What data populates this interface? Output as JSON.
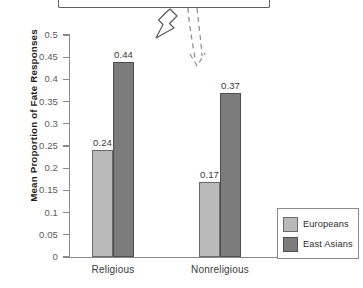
{
  "chart_data": {
    "type": "bar",
    "title": "",
    "subtitle": "",
    "xlabel": "",
    "ylabel": "Mean Proportion of Fate Responses",
    "categories": [
      "Religious",
      "Nonreligious"
    ],
    "series": [
      {
        "name": "Europeans",
        "color": "#b9b9b9",
        "values": [
          0.24,
          0.17
        ],
        "labels": [
          "0.24",
          "0.17"
        ]
      },
      {
        "name": "East Asians",
        "color": "#7c7c7c",
        "values": [
          0.44,
          0.37
        ],
        "labels": [
          "0.44",
          "0.37"
        ]
      }
    ],
    "ylim": [
      0,
      0.5
    ],
    "ytick_step": 0.05,
    "ytick_labels": [
      "0.5",
      "0.45",
      "0.4",
      "0.35",
      "0.3",
      "0.25",
      "0.2",
      "0.15",
      "0.1",
      "0.05",
      "0"
    ],
    "ytick_values": [
      0.5,
      0.45,
      0.4,
      0.35,
      0.3,
      0.25,
      0.2,
      0.15,
      0.1,
      0.05,
      0
    ],
    "grid": false,
    "legend_position": "bottom-right",
    "legend_entries": [
      "Europeans",
      "East Asians"
    ]
  },
  "annotations": {
    "callout_box": "cropped-rectangle-outline",
    "solid_arrow": "block-arrow-pointing-down-left",
    "dashed_arrow": "dashed-arrow-pointing-down"
  },
  "axis": {
    "y_title": "Mean Proportion of Fate Responses"
  },
  "legend": {
    "items": [
      {
        "label": "Europeans",
        "color": "#b9b9b9"
      },
      {
        "label": "East Asians",
        "color": "#7c7c7c"
      }
    ]
  }
}
